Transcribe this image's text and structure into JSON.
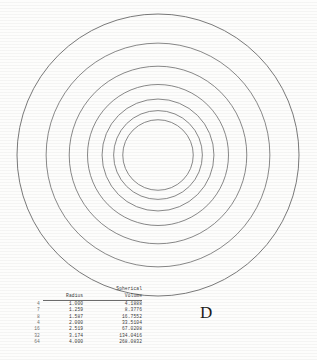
{
  "figure": {
    "label": "D",
    "background_color": "#fdfdfc",
    "stroke_color": "#6b6b6b"
  },
  "table": {
    "headers": {
      "index": "",
      "radius": "Radius",
      "volume_line1": "Spherical",
      "volume_line2": "Volume"
    },
    "rows": [
      {
        "index": "4",
        "radius": "1.000",
        "volume": "4.1888"
      },
      {
        "index": "7",
        "radius": "1.259",
        "volume": "8.3776"
      },
      {
        "index": "8",
        "radius": "1.587",
        "volume": "16.7552"
      },
      {
        "index": "4",
        "radius": "2.000",
        "volume": "33.5104"
      },
      {
        "index": "16",
        "radius": "2.519",
        "volume": "67.0208"
      },
      {
        "index": "32",
        "radius": "3.174",
        "volume": "134.0416"
      },
      {
        "index": "64",
        "radius": "4.000",
        "volume": "268.0832"
      }
    ]
  },
  "chart_data": {
    "type": "scatter",
    "title": "",
    "subtitle": "",
    "xlabel": "",
    "ylabel": "",
    "annotations": [
      "D"
    ],
    "legend_position": "none",
    "grid": false,
    "center": {
      "x": 158,
      "y": 155
    },
    "pixels_per_unit": 35.25,
    "radii_units": [
      1.0,
      1.259,
      1.587,
      2.0,
      2.519,
      3.174,
      4.0
    ],
    "radii_pixels": [
      35.25,
      44.38,
      55.94,
      70.5,
      88.79,
      111.88,
      141.0
    ],
    "volumes": [
      4.1888,
      8.3776,
      16.7552,
      33.5104,
      67.0208,
      134.0416,
      268.0832
    ],
    "series": [
      {
        "name": "Spherical Volume",
        "categories": [
          "1.000",
          "1.259",
          "1.587",
          "2.000",
          "2.519",
          "3.174",
          "4.000"
        ],
        "values": [
          4.1888,
          8.3776,
          16.7552,
          33.5104,
          67.0208,
          134.0416,
          268.0832
        ]
      }
    ]
  }
}
